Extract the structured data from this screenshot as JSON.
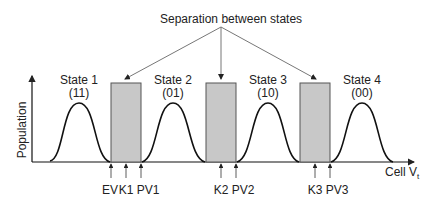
{
  "title": "Separation between states",
  "axes": {
    "ylabel": "Population",
    "xlabel": "Cell V",
    "xlabel_sub": "t"
  },
  "states": [
    {
      "name": "State 1",
      "code": "(11)"
    },
    {
      "name": "State 2",
      "code": "(01)"
    },
    {
      "name": "State 3",
      "code": "(10)"
    },
    {
      "name": "State 4",
      "code": "(00)"
    }
  ],
  "markers": [
    "EV",
    "K1",
    "PV1",
    "K2",
    "PV2",
    "K3",
    "PV3"
  ],
  "colors": {
    "box_fill": "#c8c8c8",
    "line": "#111111",
    "arrow": "#777777"
  }
}
